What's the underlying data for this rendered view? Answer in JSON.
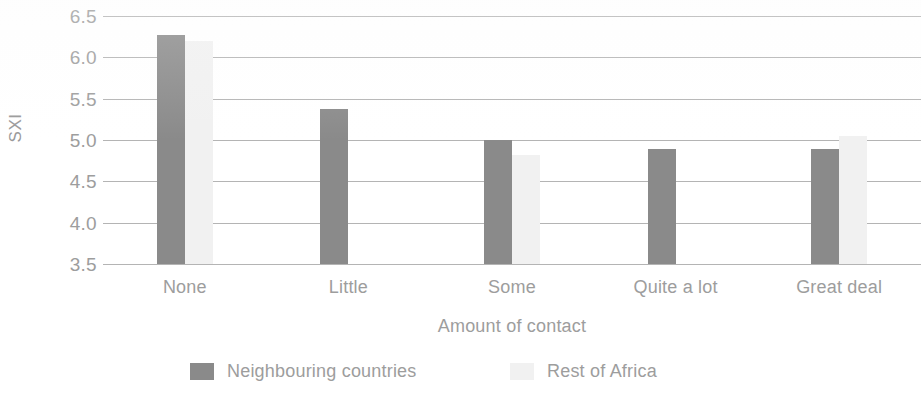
{
  "chart_data": {
    "type": "bar",
    "title": "",
    "subtitle": "",
    "xlabel": "Amount of contact",
    "ylabel": "SXI",
    "categories": [
      "None",
      "Little",
      "Some",
      "Quite a lot",
      "Great deal"
    ],
    "series": [
      {
        "name": "Neighbouring countries",
        "color": "#8a8a8a",
        "values": [
          6.27,
          5.37,
          5.0,
          4.89,
          4.89
        ]
      },
      {
        "name": "Rest of Africa",
        "color": "#f1f1f1",
        "values": [
          6.2,
          3.5,
          4.82,
          3.5,
          5.05
        ]
      }
    ],
    "ylim": [
      3.5,
      6.5
    ],
    "y_ticks": [
      "6.5",
      "6.0",
      "5.5",
      "5.0",
      "4.5",
      "4.0",
      "3.5"
    ],
    "y_tick_values": [
      6.5,
      6.0,
      5.5,
      5.0,
      4.5,
      4.0,
      3.5
    ],
    "grid": true,
    "legend_position": "bottom",
    "annotations": []
  },
  "axes": {
    "y_title": "SXI",
    "x_title": "Amount of contact"
  },
  "legend": {
    "items": [
      {
        "label": "Neighbouring countries"
      },
      {
        "label": "Rest of Africa"
      }
    ]
  }
}
